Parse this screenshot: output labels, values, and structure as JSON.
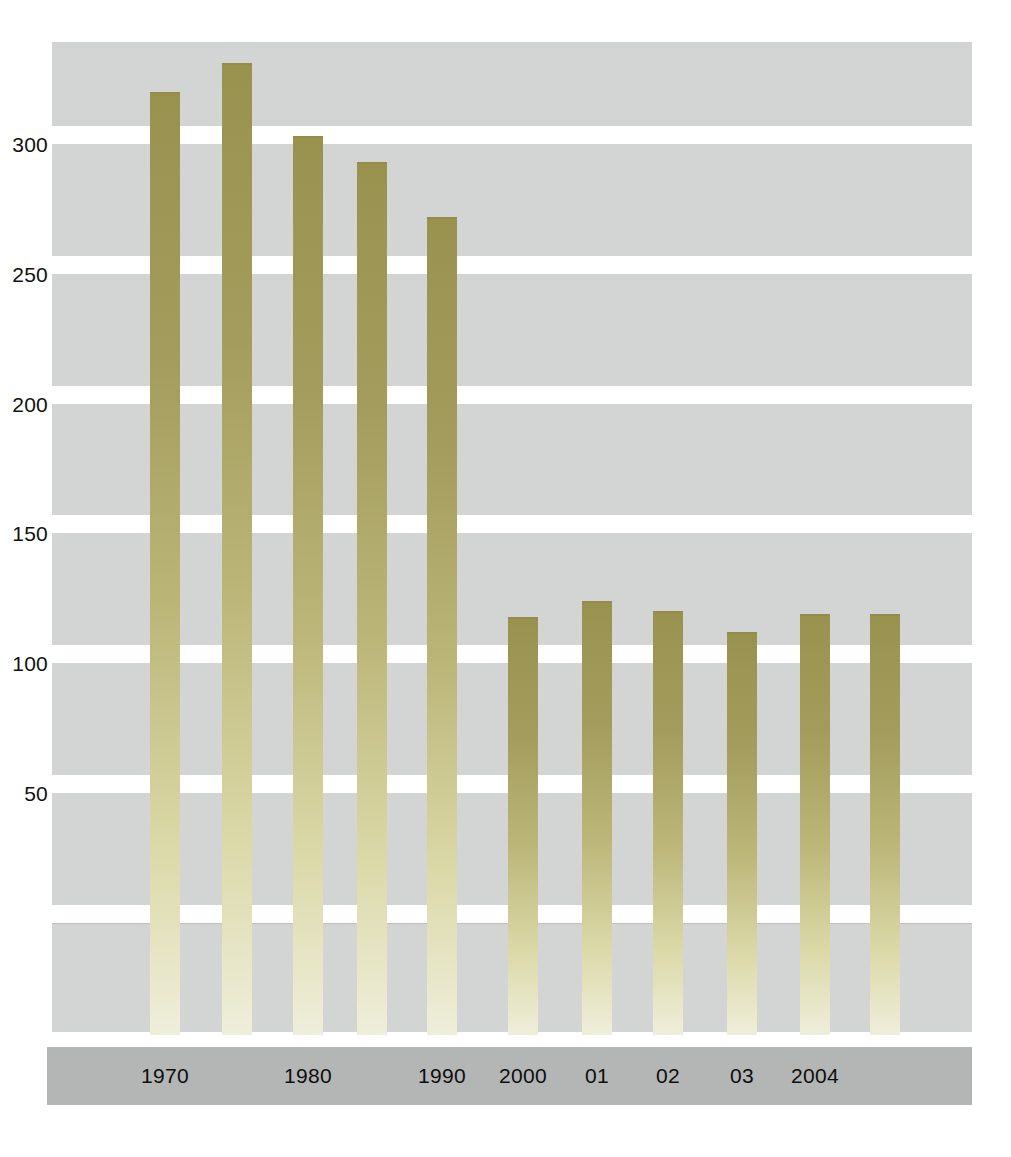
{
  "chart_data": {
    "type": "bar",
    "title": "",
    "subtitle": "",
    "xlabel": "",
    "ylabel": "",
    "grid": "horizontal-bands",
    "legend": "none",
    "ylim": [
      0,
      340
    ],
    "yticks": [
      50,
      100,
      150,
      200,
      250,
      300
    ],
    "ytick_labels": [
      "50",
      "100",
      "150",
      "200",
      "250",
      "300"
    ],
    "categories": [
      "1970",
      "1975",
      "1980",
      "1985",
      "1990",
      "2000",
      "01",
      "02",
      "03",
      "2004"
    ],
    "xtick_labels": [
      "1970",
      "1980",
      "1990",
      "2000",
      "01",
      "02",
      "03",
      "2004"
    ],
    "values": [
      320,
      331,
      303,
      293,
      272,
      118,
      124,
      120,
      112,
      119
    ],
    "bars": [
      {
        "label": "1970",
        "value": 320,
        "axis_label": "1970",
        "show_axis_label": true
      },
      {
        "label": "1975",
        "value": 331,
        "axis_label": "",
        "show_axis_label": false
      },
      {
        "label": "1980",
        "value": 303,
        "axis_label": "1980",
        "show_axis_label": true
      },
      {
        "label": "1985",
        "value": 293,
        "axis_label": "",
        "show_axis_label": false
      },
      {
        "label": "1990",
        "value": 272,
        "axis_label": "1990",
        "show_axis_label": true
      },
      {
        "label": "2000",
        "value": 118,
        "axis_label": "2000",
        "show_axis_label": true
      },
      {
        "label": "01",
        "value": 124,
        "axis_label": "01",
        "show_axis_label": true
      },
      {
        "label": "02",
        "value": 120,
        "axis_label": "02",
        "show_axis_label": true
      },
      {
        "label": "03",
        "value": 112,
        "axis_label": "03",
        "show_axis_label": true
      },
      {
        "label": "2004",
        "value": 119,
        "axis_label": "2004",
        "show_axis_label": true
      }
    ],
    "colors": {
      "bar_top": "#99924f",
      "bar_bottom": "#efeedb",
      "band": "#d3d5d4",
      "axis_strip": "#b4b6b5",
      "background": "#ffffff",
      "text": "#111111"
    }
  }
}
